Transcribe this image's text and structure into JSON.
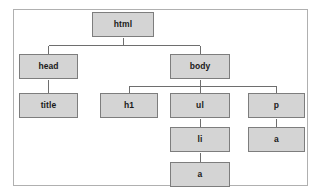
{
  "diagram": {
    "type": "tree",
    "colors": {
      "node_fill": "#d4d4d4",
      "node_border": "#7d7d7d",
      "connector": "#6e6e6e",
      "frame_border": "#b0b0b0",
      "background": "#ffffff",
      "text": "#1a1a1a"
    },
    "nodes": [
      {
        "id": "html",
        "label": "html",
        "x": 92,
        "y": 12,
        "w": 62,
        "h": 25,
        "level": 0
      },
      {
        "id": "head",
        "label": "head",
        "x": 19,
        "y": 54,
        "w": 59,
        "h": 25,
        "level": 1
      },
      {
        "id": "body",
        "label": "body",
        "x": 170,
        "y": 54,
        "w": 60,
        "h": 25,
        "level": 1
      },
      {
        "id": "title",
        "label": "title",
        "x": 19,
        "y": 93,
        "w": 59,
        "h": 25,
        "level": 2
      },
      {
        "id": "h1",
        "label": "h1",
        "x": 100,
        "y": 93,
        "w": 58,
        "h": 25,
        "level": 2
      },
      {
        "id": "ul",
        "label": "ul",
        "x": 170,
        "y": 93,
        "w": 60,
        "h": 25,
        "level": 2
      },
      {
        "id": "p",
        "label": "p",
        "x": 248,
        "y": 93,
        "w": 57,
        "h": 25,
        "level": 2
      },
      {
        "id": "li",
        "label": "li",
        "x": 170,
        "y": 127,
        "w": 60,
        "h": 25,
        "level": 3
      },
      {
        "id": "a_p",
        "label": "a",
        "x": 248,
        "y": 127,
        "w": 57,
        "h": 25,
        "level": 3
      },
      {
        "id": "a_li",
        "label": "a",
        "x": 170,
        "y": 162,
        "w": 60,
        "h": 25,
        "level": 4
      }
    ],
    "edges": [
      {
        "from": "html",
        "to": "head",
        "label": ""
      },
      {
        "from": "html",
        "to": "body",
        "label": ""
      },
      {
        "from": "head",
        "to": "title",
        "label": ""
      },
      {
        "from": "body",
        "to": "h1",
        "label": ""
      },
      {
        "from": "body",
        "to": "ul",
        "label": ""
      },
      {
        "from": "body",
        "to": "p",
        "label": ""
      },
      {
        "from": "ul",
        "to": "li",
        "label": ""
      },
      {
        "from": "li",
        "to": "a_li",
        "label": ""
      },
      {
        "from": "p",
        "to": "a_p",
        "label": ""
      }
    ],
    "frame": {
      "x": 13,
      "y": 9,
      "w": 295,
      "h": 177
    }
  }
}
